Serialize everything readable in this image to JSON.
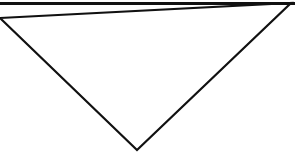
{
  "figure": {
    "title": "Inverted triangle outline",
    "background_color": "#ffffff",
    "stroke_color": "#111111",
    "fill_color": "#ffffff",
    "canvas": {
      "width": 295,
      "height": 157
    },
    "shape": {
      "name": "triangle",
      "orientation": "point-down",
      "sides": 3,
      "stroke_width_px": 2.2,
      "top_edge_stroke_width_px": 3.2,
      "vertices": [
        {
          "label": "top-left",
          "x": 0,
          "y": 18
        },
        {
          "label": "top-right",
          "x": 291,
          "y": 3
        },
        {
          "label": "bottom-apex",
          "x": 137,
          "y": 150
        }
      ],
      "points_path": "0,18 291,3 137,150",
      "top_edge": {
        "x1": 0,
        "y1": 3.5,
        "x2": 295,
        "y2": 3.5
      }
    }
  }
}
